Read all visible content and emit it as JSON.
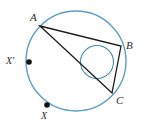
{
  "figure": {
    "name": "circle-with-inscribed-triangle-and-incircle",
    "width": 146,
    "height": 127,
    "background_color": "#ffffff"
  },
  "colors": {
    "outer_circle_stroke": "#5a9ec9",
    "inner_circle_stroke": "#3f8fa8",
    "triangle_stroke": "#1a1a1a",
    "point_fill": "#111111",
    "label_color": "#2b2b2b"
  },
  "outer_circle": {
    "name": "circumscribed-circle",
    "cx": 76,
    "cy": 61,
    "r": 50,
    "stroke_width": 1.4
  },
  "inner_circle": {
    "name": "inscribed-circle",
    "cx": 97,
    "cy": 62,
    "r": 16.5,
    "stroke_width": 1.1
  },
  "triangle": {
    "name": "inscribed-triangle-ABC",
    "stroke_width": 1.3,
    "vertices": [
      {
        "label": "A",
        "x": 40,
        "y": 26
      },
      {
        "label": "B",
        "x": 121,
        "y": 46
      },
      {
        "label": "C",
        "x": 112,
        "y": 93
      }
    ]
  },
  "labels": {
    "A": "A",
    "B": "B",
    "C": "C",
    "X_prime": "X′",
    "X": "X"
  },
  "marked_points": [
    {
      "label": "X′",
      "x": 29,
      "y": 62,
      "r": 2.8
    },
    {
      "label": "X",
      "x": 47,
      "y": 105,
      "r": 2.8
    }
  ]
}
